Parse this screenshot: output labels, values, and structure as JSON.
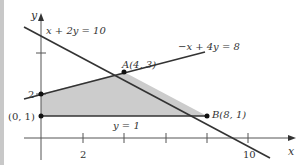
{
  "diagram": {
    "type": "linear-programming-feasible-region",
    "axes": {
      "x_label": "x",
      "y_label": "y",
      "x_tick_labels": [
        {
          "value": 2,
          "label": "2"
        },
        {
          "value": 10,
          "label": "10"
        }
      ],
      "x_ticks": [
        2,
        4,
        6,
        8,
        10
      ],
      "y_ticks": [
        2,
        4
      ],
      "y_tick_labels": [
        {
          "value": 2,
          "label": "2"
        }
      ]
    },
    "lines": [
      {
        "equation": "x + 2y = 10",
        "label": "x + 2y = 10"
      },
      {
        "equation": "-x + 4y = 8",
        "label": "−x + 4y = 8"
      },
      {
        "equation": "y = 1",
        "label": "y = 1"
      }
    ],
    "points": [
      {
        "name": "A",
        "label": "A(4, 3)",
        "x": 4,
        "y": 3
      },
      {
        "name": "B",
        "label": "B(8, 1)",
        "x": 8,
        "y": 1
      },
      {
        "name": "origin-y1",
        "label": "(0, 1)",
        "x": 0,
        "y": 1
      },
      {
        "name": "y2",
        "label": "2",
        "x": 0,
        "y": 2
      }
    ],
    "region": {
      "vertices": [
        [
          0,
          1
        ],
        [
          0,
          2
        ],
        [
          4,
          3
        ],
        [
          8,
          1
        ]
      ],
      "fill": "#cccccc"
    },
    "colors": {
      "line": "#333333",
      "axis": "#555555",
      "region": "#cccccc",
      "border": "#c8c8c8"
    }
  }
}
